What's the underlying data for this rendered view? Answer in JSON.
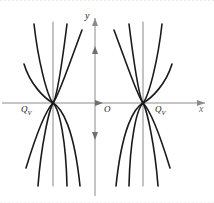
{
  "figure": {
    "title": "",
    "background_color": "#ffffff",
    "width": 214,
    "height": 203
  },
  "axes": {
    "x_label": "x",
    "y_label": "y",
    "origin_label": "O",
    "axis_color": "#8c8c8c",
    "x_axis_y_px": 103,
    "y_axis_x_px": 95,
    "x_arrow": true,
    "y_arrow_up": true,
    "y_arrow_down": true
  },
  "nodes": [
    {
      "id": "left-node",
      "label_text": "Q",
      "label_sub": "V",
      "x_px": 53,
      "y_px": 103
    },
    {
      "id": "right-node",
      "label_text": "Q",
      "label_sub": "V",
      "x_px": 143,
      "y_px": 103
    }
  ],
  "chart_data": {
    "type": "line",
    "title": "",
    "xlabel": "x",
    "ylabel": "y",
    "grid": false,
    "legend": null,
    "annotations": [
      "O",
      "Q_V",
      "Q_V",
      "x",
      "y"
    ],
    "curve_color": "#1a1a1a",
    "curve_width_px": 1.6,
    "node_points": [
      {
        "name": "Q_V left",
        "x": 53,
        "y": 103
      },
      {
        "name": "Q_V right",
        "x": 143,
        "y": 103
      }
    ],
    "series": [
      {
        "name": "left-separatrix-vertical",
        "node": "left-node",
        "path": "M 53 22 L 53 186"
      },
      {
        "name": "left-branch-u1",
        "node": "left-node",
        "path": "M 24 64 C 30 84 44 98 53 103 C 62 108 74 128 80 186"
      },
      {
        "name": "left-branch-u2",
        "node": "left-node",
        "path": "M 34 24 C 38 60 47 96 53 103 C 60 110 66 142 67 186"
      },
      {
        "name": "left-branch-u3",
        "node": "left-node",
        "path": "M 67 24 C 63 56 57 97 53 103 C 49 110 41 146 38 186"
      },
      {
        "name": "left-branch-u4",
        "node": "left-node",
        "path": "M 82 30 C 70 62 58 98 53 103 C 47 109 37 132 26 168"
      }
    ],
    "series_right": [
      {
        "name": "right-separatrix-vertical",
        "node": "right-node",
        "path": "M 143 22 L 143 186"
      },
      {
        "name": "right-branch-u1",
        "node": "right-node",
        "path": "M 172 64 C 166 84 152 98 143 103 C 134 108 122 128 116 186"
      },
      {
        "name": "right-branch-u2",
        "node": "right-node",
        "path": "M 162 24 C 158 60 149 96 143 103 C 136 110 130 142 129 186"
      },
      {
        "name": "right-branch-u3",
        "node": "right-node",
        "path": "M 129 24 C 133 56 139 97 143 103 C 147 110 155 146 158 186"
      },
      {
        "name": "right-branch-u4",
        "node": "right-node",
        "path": "M 114 30 C 126 62 138 98 143 103 C 149 109 159 132 170 168"
      }
    ],
    "xlim": [
      0,
      214
    ],
    "ylim": [
      0,
      203
    ]
  }
}
